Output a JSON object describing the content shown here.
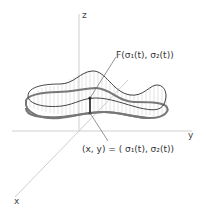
{
  "axes": {
    "x_label": "x",
    "y_label": "y",
    "z_label": "z"
  },
  "labels": {
    "top": "F(σ₁(t), σ₂(t))",
    "bottom": "(x, y) = ( σ₁(t), σ₂(t))"
  },
  "colors": {
    "axis": "#c8c8c8",
    "curve": "#555555",
    "hatch": "#bbbbbb",
    "text": "#333333"
  }
}
